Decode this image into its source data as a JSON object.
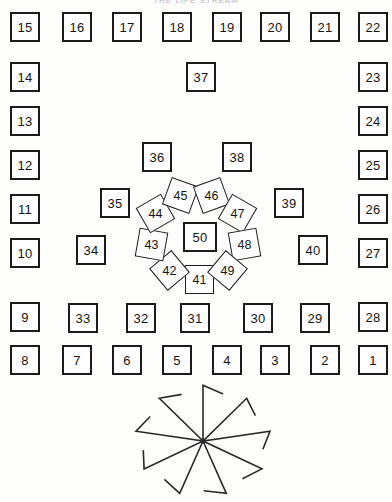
{
  "diagram": {
    "caption": "THE LIFE STREAM",
    "cell_count": 50
  },
  "outer_top_row": {
    "label": "top-row",
    "cells": [
      {
        "n": "15",
        "x": 10,
        "y": 12
      },
      {
        "n": "16",
        "x": 62,
        "y": 12
      },
      {
        "n": "17",
        "x": 112,
        "y": 12
      },
      {
        "n": "18",
        "x": 162,
        "y": 12
      },
      {
        "n": "19",
        "x": 212,
        "y": 12
      },
      {
        "n": "20",
        "x": 260,
        "y": 12
      },
      {
        "n": "21",
        "x": 310,
        "y": 12
      },
      {
        "n": "22",
        "x": 358,
        "y": 12
      }
    ]
  },
  "outer_left_column": {
    "label": "left-column",
    "cells": [
      {
        "n": "14",
        "x": 10,
        "y": 62
      },
      {
        "n": "13",
        "x": 10,
        "y": 106
      },
      {
        "n": "12",
        "x": 10,
        "y": 150
      },
      {
        "n": "11",
        "x": 10,
        "y": 194
      },
      {
        "n": "10",
        "x": 10,
        "y": 238
      },
      {
        "n": "9",
        "x": 10,
        "y": 302
      },
      {
        "n": "8",
        "x": 10,
        "y": 345
      }
    ]
  },
  "outer_right_column": {
    "label": "right-column",
    "cells": [
      {
        "n": "23",
        "x": 358,
        "y": 62
      },
      {
        "n": "24",
        "x": 358,
        "y": 106
      },
      {
        "n": "25",
        "x": 358,
        "y": 150
      },
      {
        "n": "26",
        "x": 358,
        "y": 194
      },
      {
        "n": "27",
        "x": 358,
        "y": 238
      },
      {
        "n": "28",
        "x": 358,
        "y": 302
      },
      {
        "n": "1",
        "x": 358,
        "y": 345
      }
    ]
  },
  "outer_bottom_row": {
    "label": "bottom-row",
    "cells": [
      {
        "n": "8",
        "x": 10,
        "y": 345
      },
      {
        "n": "7",
        "x": 62,
        "y": 345
      },
      {
        "n": "6",
        "x": 112,
        "y": 345
      },
      {
        "n": "5",
        "x": 162,
        "y": 345
      },
      {
        "n": "4",
        "x": 212,
        "y": 345
      },
      {
        "n": "3",
        "x": 260,
        "y": 345
      },
      {
        "n": "2",
        "x": 310,
        "y": 345
      },
      {
        "n": "1",
        "x": 358,
        "y": 345
      }
    ]
  },
  "inner_bottom_row": {
    "label": "inner-bottom-row",
    "cells": [
      {
        "n": "33",
        "x": 68,
        "y": 303
      },
      {
        "n": "32",
        "x": 126,
        "y": 303
      },
      {
        "n": "31",
        "x": 180,
        "y": 303
      },
      {
        "n": "30",
        "x": 243,
        "y": 303
      },
      {
        "n": "29",
        "x": 300,
        "y": 303
      }
    ]
  },
  "inner_ring_cells": {
    "label": "inner-ring",
    "cells": [
      {
        "n": "37",
        "x": 186,
        "y": 62
      },
      {
        "n": "36",
        "x": 142,
        "y": 142
      },
      {
        "n": "38",
        "x": 222,
        "y": 142
      },
      {
        "n": "35",
        "x": 100,
        "y": 188
      },
      {
        "n": "39",
        "x": 274,
        "y": 188
      },
      {
        "n": "34",
        "x": 76,
        "y": 235
      },
      {
        "n": "40",
        "x": 298,
        "y": 235
      }
    ]
  },
  "petal_ring": {
    "label": "petal-ring",
    "center": {
      "n": "50",
      "x": 183,
      "y": 222
    },
    "petals": [
      {
        "n": "41",
        "x": 185,
        "y": 265,
        "rot": 0
      },
      {
        "n": "42",
        "x": 155,
        "y": 256,
        "rot": -40
      },
      {
        "n": "43",
        "x": 137,
        "y": 230,
        "rot": -80
      },
      {
        "n": "44",
        "x": 141,
        "y": 199,
        "rot": -120
      },
      {
        "n": "45",
        "x": 166,
        "y": 181,
        "rot": -160
      },
      {
        "n": "46",
        "x": 197,
        "y": 181,
        "rot": 160
      },
      {
        "n": "47",
        "x": 223,
        "y": 199,
        "rot": 120
      },
      {
        "n": "48",
        "x": 230,
        "y": 230,
        "rot": 80
      },
      {
        "n": "49",
        "x": 213,
        "y": 256,
        "rot": 40
      }
    ]
  },
  "pinwheel": {
    "label": "pinwheel-figure",
    "spokes": 9,
    "center": {
      "x": 85,
      "y": 63
    },
    "radius": 68,
    "hook_length": 22,
    "stroke": "#2a2a2a"
  },
  "colors": {
    "ink": "#1b1b1b",
    "paper": "#fdfdfc"
  }
}
